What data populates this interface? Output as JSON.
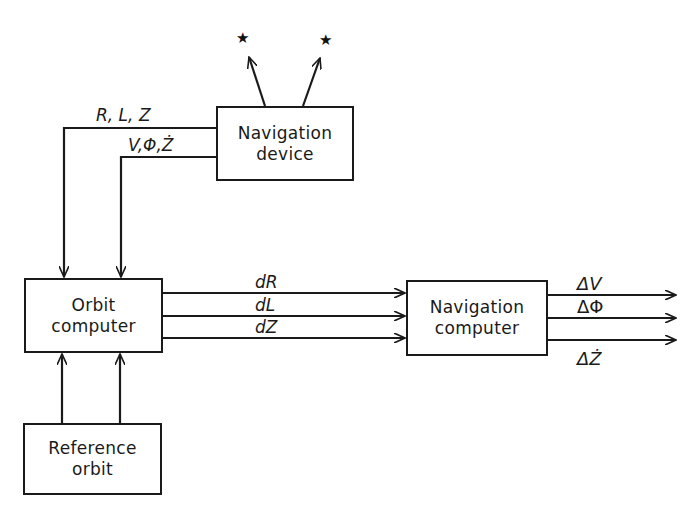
{
  "diagram": {
    "type": "block-diagram",
    "blocks": {
      "navigation_device": {
        "line1": "Navigation",
        "line2": "device"
      },
      "orbit_computer": {
        "line1": "Orbit",
        "line2": "computer"
      },
      "navigation_computer": {
        "line1": "Navigation",
        "line2": "computer"
      },
      "reference_orbit": {
        "line1": "Reference",
        "line2": "orbit"
      }
    },
    "signals": {
      "nav_to_orbit_top": "R, L, Z",
      "nav_to_orbit_bottom": "V,Φ,Ż",
      "orbit_to_nav_1": "dR",
      "orbit_to_nav_2": "dL",
      "orbit_to_nav_3": "dZ",
      "output_1": "ΔV",
      "output_2": "ΔΦ",
      "output_3": "ΔŻ"
    },
    "stars": {
      "left": "★",
      "right": "★"
    },
    "edges": [
      {
        "from": "navigation_device",
        "to": "star_left"
      },
      {
        "from": "navigation_device",
        "to": "star_right"
      },
      {
        "from": "navigation_device",
        "to": "orbit_computer",
        "label": "R, L, Z"
      },
      {
        "from": "navigation_device",
        "to": "orbit_computer",
        "label": "V,Φ,Ż"
      },
      {
        "from": "reference_orbit",
        "to": "orbit_computer"
      },
      {
        "from": "reference_orbit",
        "to": "orbit_computer"
      },
      {
        "from": "orbit_computer",
        "to": "navigation_computer",
        "label": "dR"
      },
      {
        "from": "orbit_computer",
        "to": "navigation_computer",
        "label": "dL"
      },
      {
        "from": "orbit_computer",
        "to": "navigation_computer",
        "label": "dZ"
      },
      {
        "from": "navigation_computer",
        "to": "output",
        "label": "ΔV"
      },
      {
        "from": "navigation_computer",
        "to": "output",
        "label": "ΔΦ"
      },
      {
        "from": "navigation_computer",
        "to": "output",
        "label": "ΔŻ"
      }
    ]
  }
}
